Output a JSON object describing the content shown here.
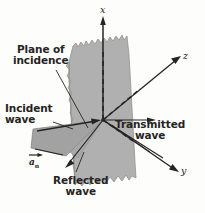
{
  "figure": {
    "background_color": "#fdfdfb",
    "ink_color": "#262423",
    "plane_fill": "#b0b0b0",
    "plane_stroke": "#8f8f8f",
    "wedge_fill": "#a2a2a2",
    "wedge_stroke": "#7e7e7e"
  },
  "labels": {
    "plane_of_incidence_line1": "Plane of",
    "plane_of_incidence_line2": "incidence",
    "incident_wave_line1": "Incident",
    "incident_wave_line2": "wave",
    "transmitted_wave_line1": "Transmitted",
    "transmitted_wave_line2": "wave",
    "reflected_wave_line1": "Reflected",
    "reflected_wave_line2": "wave",
    "normal_vector": "a",
    "normal_vector_subscript": "n"
  },
  "axes": {
    "x": "x",
    "y": "y",
    "z": "z"
  },
  "geometry": {
    "origin": {
      "x": 103,
      "y": 120
    },
    "axis_x_tip": {
      "x": 103,
      "y": 18
    },
    "axis_z_tip": {
      "x": 180,
      "y": 57
    },
    "axis_y_tip": {
      "x": 179,
      "y": 172
    },
    "incident_ray_start": {
      "x": 36,
      "y": 133
    },
    "reflected_ray_tip": {
      "x": 65,
      "y": 168
    },
    "transmitted_ray_tip": {
      "x": 155,
      "y": 120
    }
  }
}
